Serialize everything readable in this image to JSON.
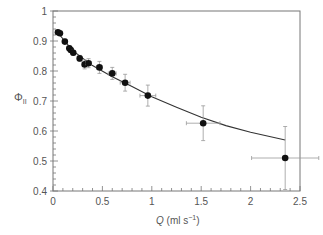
{
  "chart_data": {
    "type": "scatter",
    "title": "",
    "xlabel": "Q (ml s⁻¹)",
    "xlabel_var": "Q",
    "xlabel_unit": " (ml s",
    "xlabel_sup": "−1",
    "xlabel_close": ")",
    "ylabel": "ΦII",
    "ylabel_main": "Φ",
    "ylabel_sub": "II",
    "xlim": [
      0,
      2.5
    ],
    "ylim": [
      0.4,
      1.0
    ],
    "xticks": [
      "0",
      "0.5",
      "1",
      "1.5",
      "2",
      "2.5"
    ],
    "yticks": [
      "0.4",
      "0.5",
      "0.6",
      "0.7",
      "0.8",
      "0.9",
      "1"
    ],
    "grid": false,
    "legend": null,
    "series": [
      {
        "name": "measured",
        "style": "filled-circle-with-error-bars",
        "points": [
          {
            "x": 0.05,
            "y": 0.929,
            "xerr": 0.0,
            "yerr": 0.006
          },
          {
            "x": 0.07,
            "y": 0.926,
            "xerr": 0.0,
            "yerr": 0.006
          },
          {
            "x": 0.12,
            "y": 0.898,
            "xerr": 0.0,
            "yerr": 0.008
          },
          {
            "x": 0.165,
            "y": 0.876,
            "xerr": 0.0,
            "yerr": 0.008
          },
          {
            "x": 0.18,
            "y": 0.87,
            "xerr": 0.0,
            "yerr": 0.008
          },
          {
            "x": 0.205,
            "y": 0.861,
            "xerr": 0.0,
            "yerr": 0.008
          },
          {
            "x": 0.27,
            "y": 0.842,
            "xerr": 0.02,
            "yerr": 0.01
          },
          {
            "x": 0.32,
            "y": 0.822,
            "xerr": 0.02,
            "yerr": 0.015
          },
          {
            "x": 0.36,
            "y": 0.826,
            "xerr": 0.03,
            "yerr": 0.015
          },
          {
            "x": 0.47,
            "y": 0.812,
            "xerr": 0.03,
            "yerr": 0.02
          },
          {
            "x": 0.6,
            "y": 0.792,
            "xerr": 0.04,
            "yerr": 0.02
          },
          {
            "x": 0.73,
            "y": 0.761,
            "xerr": 0.05,
            "yerr": 0.028
          },
          {
            "x": 0.96,
            "y": 0.718,
            "xerr": 0.08,
            "yerr": 0.035
          },
          {
            "x": 1.52,
            "y": 0.626,
            "xerr": 0.17,
            "yerr": 0.058
          },
          {
            "x": 2.35,
            "y": 0.51,
            "xerr": 0.34,
            "yerr": 0.105
          }
        ]
      },
      {
        "name": "fit",
        "style": "line",
        "points": [
          {
            "x": 0.03,
            "y": 0.935
          },
          {
            "x": 0.2,
            "y": 0.868
          },
          {
            "x": 0.4,
            "y": 0.818
          },
          {
            "x": 0.6,
            "y": 0.781
          },
          {
            "x": 0.8,
            "y": 0.748
          },
          {
            "x": 1.0,
            "y": 0.714
          },
          {
            "x": 1.25,
            "y": 0.679
          },
          {
            "x": 1.5,
            "y": 0.646
          },
          {
            "x": 1.75,
            "y": 0.618
          },
          {
            "x": 2.0,
            "y": 0.596
          },
          {
            "x": 2.35,
            "y": 0.57
          }
        ]
      }
    ]
  },
  "colors": {
    "axis": "#777777",
    "marker": "#111111",
    "errorbar": "#999999",
    "line": "#333333",
    "text": "#555555"
  }
}
